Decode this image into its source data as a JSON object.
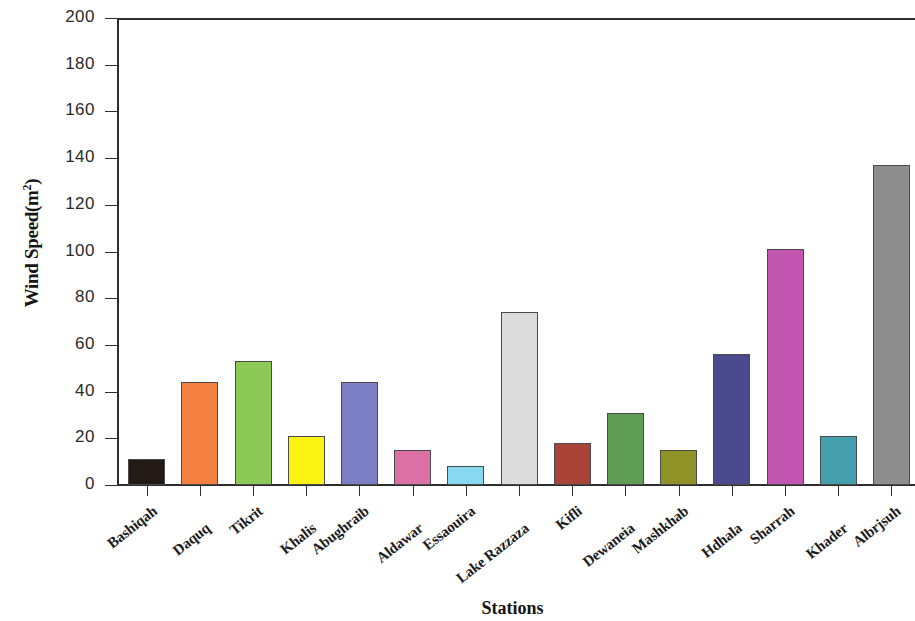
{
  "chart_data": {
    "type": "bar",
    "title": "",
    "xlabel": "Stations",
    "ylabel": "Wind Speed(m2)",
    "ylabel_base": "Wind Speed(m",
    "ylabel_sup": "2",
    "ylabel_close": ")",
    "ylim": [
      0,
      200
    ],
    "xlim_grid": false,
    "grid": false,
    "legend": null,
    "ytick_labels": [
      "200",
      "180",
      "160",
      "140",
      "120",
      "100",
      "80",
      "60",
      "40",
      "20",
      "0"
    ],
    "ytick_values": [
      200,
      180,
      160,
      140,
      120,
      100,
      80,
      60,
      40,
      20,
      0
    ],
    "categories": [
      "Bashiqah",
      "Daquq",
      "Tikrit",
      "Khalis",
      "Abughraib",
      "Aldawar",
      "Essaouira",
      "Lake Razzaza",
      "Kifli",
      "Dewaneia",
      "Mashkhab",
      "Hdhala",
      "Sharrah",
      "Khader",
      "Albrjsuh"
    ],
    "values": [
      11,
      44,
      53,
      21,
      44,
      15,
      8,
      74,
      18,
      31,
      15,
      56,
      101,
      21,
      137
    ],
    "bar_colors": [
      "#231a16",
      "#f4813f",
      "#8cc957",
      "#fbf312",
      "#7d7fc4",
      "#dc6fa4",
      "#87d9f2",
      "#dcdcdc",
      "#a84438",
      "#5f9c54",
      "#8f9226",
      "#4c4a8f",
      "#c martial",
      "#45a0ad",
      "#8e8e8e"
    ],
    "bar_colors_fixed": [
      "#231a16",
      "#f4813f",
      "#8cc957",
      "#fbf312",
      "#7d7fc4",
      "#dc6fa4",
      "#87d9f2",
      "#dcdcdc",
      "#a84438",
      "#5f9c54",
      "#8f9226",
      "#4c4a8f",
      "#c155b0",
      "#45a0ad",
      "#8e8e8e"
    ]
  }
}
